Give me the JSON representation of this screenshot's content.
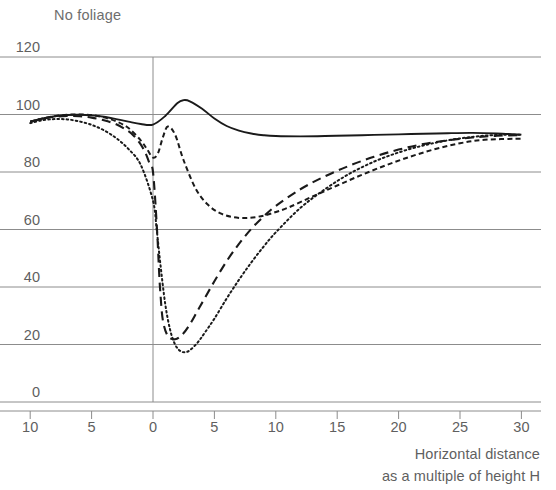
{
  "title": "No foliage",
  "axis": {
    "x_caption_line1": "Horizontal distance",
    "x_caption_line2": "as a multiple of height H",
    "x_tick_labels": [
      "10",
      "5",
      "0",
      "5",
      "10",
      "15",
      "20",
      "25",
      "30"
    ],
    "y_tick_labels": [
      "0",
      "20",
      "40",
      "60",
      "80",
      "100",
      "120"
    ]
  },
  "colors": {
    "curve": "#1a1a1a",
    "grid": "#8c8c8c",
    "axis": "#8c8c8c",
    "text": "#5f5f5f",
    "title_text": "#6e6e6e",
    "background": "#ffffff"
  },
  "chart_data": {
    "type": "line",
    "title": "No foliage",
    "xlabel": "Horizontal distance as a multiple of height H",
    "ylabel": "",
    "xlim": [
      -10,
      30
    ],
    "ylim": [
      0,
      120
    ],
    "grid": true,
    "legend": "none",
    "x_ticks": [
      -10,
      -5,
      0,
      5,
      10,
      15,
      20,
      25,
      30
    ],
    "x_tick_labels": [
      "10",
      "5",
      "0",
      "5",
      "10",
      "15",
      "20",
      "25",
      "30"
    ],
    "y_ticks": [
      0,
      20,
      40,
      60,
      80,
      100,
      120
    ],
    "series": [
      {
        "name": "solid",
        "style": "solid",
        "x": [
          -10,
          -9,
          -8,
          -7,
          -6,
          -5,
          -4,
          -3,
          -2,
          -1,
          0,
          1,
          2,
          2.5,
          3,
          4,
          5,
          6,
          7,
          8,
          9,
          10,
          12,
          14,
          16,
          18,
          20,
          22,
          24,
          26,
          28,
          30
        ],
        "y": [
          97.5,
          98.6,
          99.4,
          99.8,
          99.9,
          99.7,
          99.2,
          98.4,
          97.5,
          96.7,
          96.5,
          99.5,
          104.0,
          105.0,
          104.6,
          102.0,
          98.6,
          96.0,
          94.4,
          93.4,
          92.8,
          92.5,
          92.4,
          92.5,
          92.7,
          92.9,
          93.1,
          93.3,
          93.5,
          93.6,
          93.4,
          93.0
        ]
      },
      {
        "name": "short-dash",
        "style": "short-dash",
        "x": [
          -10,
          -9,
          -8,
          -7,
          -6,
          -5,
          -4,
          -3,
          -2,
          -1,
          -0.5,
          0,
          0.4,
          0.8,
          1.2,
          1.8,
          2.5,
          3.5,
          4.5,
          5.5,
          6.5,
          7.5,
          8.5,
          9.5,
          11,
          13,
          15,
          17,
          19,
          21,
          23,
          25,
          27,
          30
        ],
        "y": [
          97.5,
          98.6,
          99.4,
          99.9,
          100.0,
          99.8,
          99.0,
          97.6,
          95.3,
          91.0,
          88.0,
          85.0,
          86.5,
          92.0,
          95.8,
          93.0,
          84.0,
          74.0,
          68.5,
          65.6,
          64.3,
          64.0,
          64.4,
          65.4,
          67.6,
          71.5,
          75.3,
          79.0,
          82.4,
          85.4,
          88.0,
          90.0,
          91.2,
          91.6
        ]
      },
      {
        "name": "long-dash",
        "style": "long-dash",
        "x": [
          -10,
          -9,
          -8,
          -7,
          -6,
          -5,
          -4,
          -3,
          -2,
          -1.5,
          -1,
          -0.6,
          -0.3,
          0,
          0.3,
          0.5,
          0.6,
          0.8,
          1.2,
          1.8,
          2.4,
          3,
          3.6,
          4.2,
          5,
          6,
          7,
          8,
          9,
          10,
          12,
          14,
          16,
          18,
          20,
          22,
          24,
          26,
          28,
          30
        ],
        "y": [
          97.5,
          98.5,
          99.2,
          99.5,
          99.4,
          98.9,
          98.0,
          96.6,
          94.2,
          92.3,
          89.6,
          86.5,
          83.2,
          80.0,
          62.0,
          45.0,
          38.0,
          28.5,
          23.0,
          21.8,
          23.5,
          27.0,
          31.5,
          36.0,
          42.0,
          49.0,
          55.0,
          60.2,
          64.5,
          68.2,
          74.0,
          78.5,
          82.2,
          85.3,
          87.8,
          89.7,
          91.0,
          92.0,
          92.6,
          92.8
        ]
      },
      {
        "name": "dotted",
        "style": "dotted",
        "x": [
          -10,
          -9,
          -8,
          -7,
          -6,
          -5,
          -4,
          -3,
          -2,
          -1,
          0,
          0.3,
          0.6,
          1,
          1.4,
          1.8,
          2.2,
          2.6,
          3,
          3.6,
          4.2,
          5,
          6,
          7,
          8,
          9,
          10,
          12,
          14,
          16,
          18,
          20,
          22,
          24,
          26,
          28,
          30
        ],
        "y": [
          97.0,
          98.0,
          98.4,
          98.3,
          97.6,
          96.4,
          94.5,
          91.8,
          88.0,
          82.5,
          70.0,
          60.0,
          48.0,
          34.0,
          25.0,
          20.0,
          17.8,
          17.3,
          18.0,
          20.5,
          24.0,
          29.0,
          36.0,
          42.5,
          48.5,
          54.0,
          59.0,
          67.5,
          74.0,
          79.4,
          83.6,
          86.8,
          89.2,
          91.0,
          92.2,
          92.9,
          93.0
        ]
      }
    ]
  }
}
